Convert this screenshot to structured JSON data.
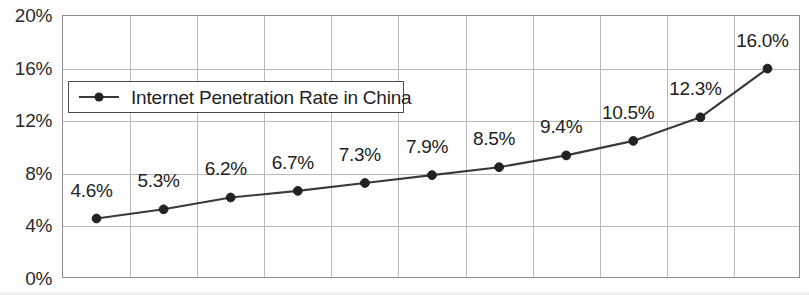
{
  "chart_data": {
    "type": "line",
    "title": "",
    "xlabel": "",
    "ylabel": "",
    "ylim": [
      0,
      20
    ],
    "yticks": [
      "0%",
      "4%",
      "8%",
      "12%",
      "16%",
      "20%"
    ],
    "ytick_values": [
      0,
      4,
      8,
      12,
      16,
      20
    ],
    "grid": true,
    "legend_position": "upper-left-inside",
    "categories": [
      "",
      "",
      "",
      "",
      "",
      "",
      "",
      "",
      "",
      "",
      ""
    ],
    "series": [
      {
        "name": "Internet Penetration Rate in China",
        "values": [
          4.6,
          5.3,
          6.2,
          6.7,
          7.3,
          7.9,
          8.5,
          9.4,
          10.5,
          12.3,
          16.0
        ],
        "data_labels": [
          "4.6%",
          "5.3%",
          "6.2%",
          "6.7%",
          "7.3%",
          "7.9%",
          "8.5%",
          "9.4%",
          "10.5%",
          "12.3%",
          "16.0%"
        ],
        "line_color": "#3a3a3a",
        "marker_color": "#222222",
        "marker": "circle"
      }
    ]
  },
  "legend": {
    "entries": [
      {
        "label": "Internet Penetration Rate in China"
      }
    ]
  },
  "colors": {
    "line": "#3a3a3a",
    "marker": "#222222",
    "grid": "#b9b9b9",
    "frame": "#8d8d8d",
    "text": "#222222",
    "background": "#ffffff"
  }
}
